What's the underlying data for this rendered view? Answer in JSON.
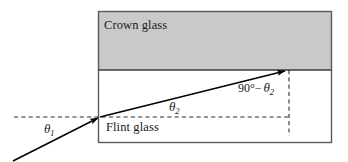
{
  "figure": {
    "type": "optics-refraction-diagram",
    "width": 348,
    "height": 162,
    "colors": {
      "crown_glass_fill": "#c9c9c9",
      "flint_glass_fill": "#ffffff",
      "border": "#4a4a4a",
      "ray": "#000000",
      "dashed": "#333333",
      "text": "#1a1a1a",
      "background": "#ffffff"
    }
  },
  "regions": {
    "crown_glass": {
      "label": "Crown glass",
      "x": 98,
      "y": 11,
      "width": 234,
      "height": 59
    },
    "flint_glass": {
      "label": "Flint glass",
      "x": 98,
      "y": 70,
      "width": 234,
      "height": 73
    }
  },
  "labels": {
    "theta1": {
      "symbol": "θ",
      "subscript": "1"
    },
    "theta2": {
      "symbol": "θ",
      "subscript": "2"
    },
    "complement": {
      "prefix": "90°−",
      "symbol": "θ",
      "subscript": "2"
    }
  },
  "geometry": {
    "interface_y": 70,
    "incidence_point": {
      "x": 100,
      "y": 117
    },
    "refraction_point": {
      "x": 287,
      "y": 70
    },
    "incident_ray": {
      "x1": 13,
      "y1": 161,
      "x2": 100,
      "y2": 117
    },
    "refracted_ray": {
      "x1": 100,
      "y1": 117,
      "x2": 287,
      "y2": 70
    },
    "horizontal_dashed": {
      "x1": 14,
      "y1": 117,
      "x2": 289,
      "y2": 117
    },
    "vertical_dashed": {
      "x1": 289,
      "y1": 70,
      "x2": 289,
      "y2": 136
    },
    "outer_box": {
      "x": 98,
      "y": 11,
      "width": 234,
      "height": 132
    }
  }
}
